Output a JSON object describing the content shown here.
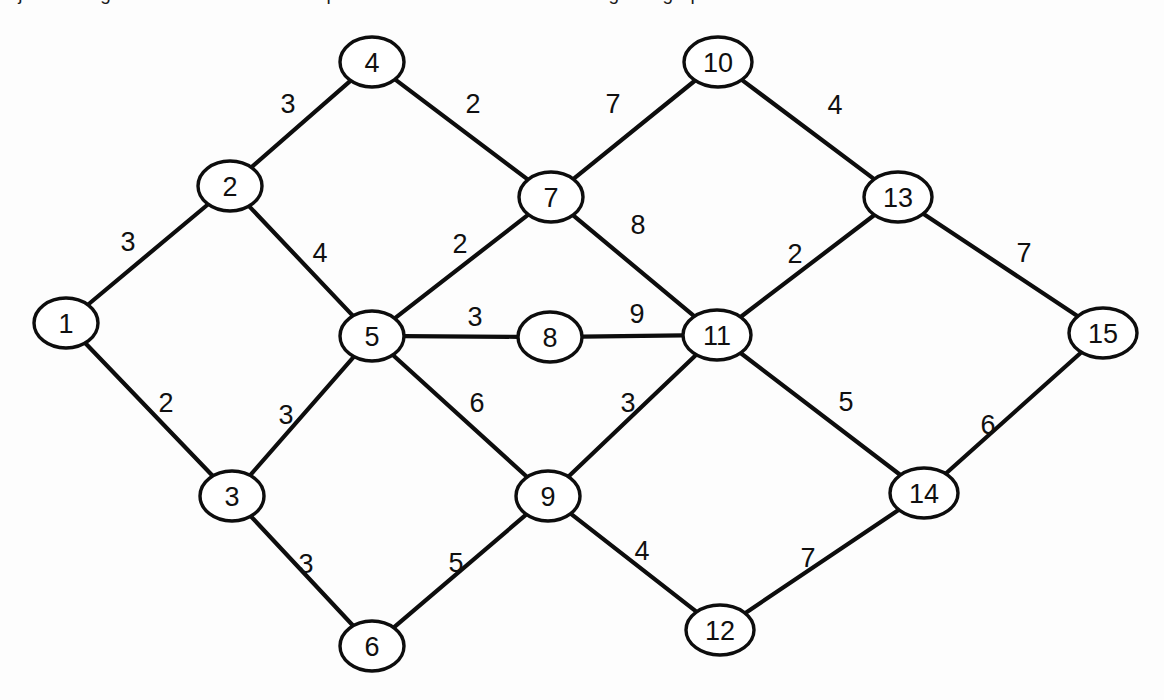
{
  "figure": {
    "title_fragment": "Dijkstra's Algorithm - find the shortest path between two nodes in a weighted graph",
    "background_color": "#fdfdfd",
    "node_fill": "#ffffff",
    "stroke_color": "#0d0d0d"
  },
  "graph": {
    "node_count": 15,
    "edge_count": 22,
    "nodes": [
      {
        "id": "1",
        "label": "1",
        "cx": 66,
        "cy": 323,
        "rx": 32,
        "ry": 25
      },
      {
        "id": "2",
        "label": "2",
        "cx": 230,
        "cy": 186,
        "rx": 32,
        "ry": 25
      },
      {
        "id": "3",
        "label": "3",
        "cx": 232,
        "cy": 496,
        "rx": 32,
        "ry": 25
      },
      {
        "id": "4",
        "label": "4",
        "cx": 372,
        "cy": 62,
        "rx": 32,
        "ry": 25
      },
      {
        "id": "5",
        "label": "5",
        "cx": 372,
        "cy": 336,
        "rx": 32,
        "ry": 25
      },
      {
        "id": "6",
        "label": "6",
        "cx": 372,
        "cy": 646,
        "rx": 32,
        "ry": 25
      },
      {
        "id": "7",
        "label": "7",
        "cx": 551,
        "cy": 197,
        "rx": 32,
        "ry": 25
      },
      {
        "id": "8",
        "label": "8",
        "cx": 550,
        "cy": 337,
        "rx": 32,
        "ry": 25
      },
      {
        "id": "9",
        "label": "9",
        "cx": 548,
        "cy": 496,
        "rx": 32,
        "ry": 25
      },
      {
        "id": "10",
        "label": "10",
        "cx": 718,
        "cy": 62,
        "rx": 34,
        "ry": 25
      },
      {
        "id": "11",
        "label": "11",
        "cx": 717,
        "cy": 335,
        "rx": 34,
        "ry": 25
      },
      {
        "id": "12",
        "label": "12",
        "cx": 720,
        "cy": 630,
        "rx": 34,
        "ry": 25
      },
      {
        "id": "13",
        "label": "13",
        "cx": 898,
        "cy": 197,
        "rx": 34,
        "ry": 25
      },
      {
        "id": "14",
        "label": "14",
        "cx": 924,
        "cy": 493,
        "rx": 34,
        "ry": 25
      },
      {
        "id": "15",
        "label": "15",
        "cx": 1103,
        "cy": 333,
        "rx": 34,
        "ry": 25
      }
    ],
    "edges": [
      {
        "from": "1",
        "to": "2",
        "weight": "3",
        "lx": 128,
        "ly": 242
      },
      {
        "from": "1",
        "to": "3",
        "weight": "2",
        "lx": 166,
        "ly": 403
      },
      {
        "from": "2",
        "to": "4",
        "weight": "3",
        "lx": 288,
        "ly": 104
      },
      {
        "from": "2",
        "to": "5",
        "weight": "4",
        "lx": 320,
        "ly": 253
      },
      {
        "from": "3",
        "to": "5",
        "weight": "3",
        "lx": 286,
        "ly": 415
      },
      {
        "from": "3",
        "to": "6",
        "weight": "3",
        "lx": 306,
        "ly": 564
      },
      {
        "from": "4",
        "to": "7",
        "weight": "2",
        "lx": 473,
        "ly": 104
      },
      {
        "from": "5",
        "to": "7",
        "weight": "2",
        "lx": 460,
        "ly": 244
      },
      {
        "from": "5",
        "to": "8",
        "weight": "3",
        "lx": 475,
        "ly": 317
      },
      {
        "from": "5",
        "to": "9",
        "weight": "6",
        "lx": 477,
        "ly": 403
      },
      {
        "from": "6",
        "to": "9",
        "weight": "5",
        "lx": 456,
        "ly": 563
      },
      {
        "from": "7",
        "to": "10",
        "weight": "7",
        "lx": 613,
        "ly": 104
      },
      {
        "from": "7",
        "to": "11",
        "weight": "8",
        "lx": 638,
        "ly": 225
      },
      {
        "from": "8",
        "to": "11",
        "weight": "9",
        "lx": 637,
        "ly": 314
      },
      {
        "from": "9",
        "to": "11",
        "weight": "3",
        "lx": 628,
        "ly": 403
      },
      {
        "from": "9",
        "to": "12",
        "weight": "4",
        "lx": 642,
        "ly": 551
      },
      {
        "from": "10",
        "to": "13",
        "weight": "4",
        "lx": 835,
        "ly": 105
      },
      {
        "from": "11",
        "to": "13",
        "weight": "2",
        "lx": 795,
        "ly": 254
      },
      {
        "from": "11",
        "to": "14",
        "weight": "5",
        "lx": 846,
        "ly": 402
      },
      {
        "from": "12",
        "to": "14",
        "weight": "7",
        "lx": 808,
        "ly": 558
      },
      {
        "from": "13",
        "to": "15",
        "weight": "7",
        "lx": 1024,
        "ly": 253
      },
      {
        "from": "14",
        "to": "15",
        "weight": "6",
        "lx": 988,
        "ly": 425
      }
    ]
  }
}
